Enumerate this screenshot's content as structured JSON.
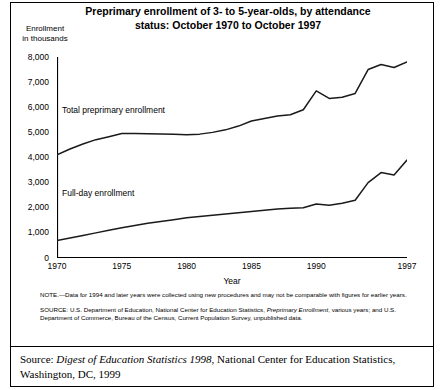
{
  "title": {
    "line1": "Preprimary enrollment of 3- to 5-year-olds, by attendance",
    "line2": "status:  October 1970 to October 1997"
  },
  "axis_caption": {
    "line1": "Enrollment",
    "line2": "in thousands"
  },
  "notes": {
    "note": "NOTE.—Data for 1994 and later years were collected using new procedures and may not be comparable with figures for earlier years.",
    "source_pre": "SOURCE:  U.S. Department of Education, National Center for Education Statistics, ",
    "source_italic": "Preprimary Enrollment",
    "source_post": ", various years; and U.S. Department of Commerce, Bureau of the Census, Current Population Survey, unpublished data."
  },
  "citation": {
    "prefix": "Source: ",
    "italic": "Digest of Education Statistics 1998",
    "suffix": ", National Center for Education Statistics, Washington, DC, 1999"
  },
  "chart_data": {
    "type": "line",
    "title": "Preprimary enrollment of 3- to 5-year-olds, by attendance status:  October 1970 to October 1997",
    "xlabel": "Year",
    "ylabel": "Enrollment in thousands",
    "xlim": [
      1970,
      1997
    ],
    "ylim": [
      0,
      8000
    ],
    "ytick_labels": [
      "8,000",
      "7,000",
      "6,000",
      "5,000",
      "4,000",
      "3,000",
      "2,000",
      "1,000",
      "0"
    ],
    "ytick_values": [
      8000,
      7000,
      6000,
      5000,
      4000,
      3000,
      2000,
      1000,
      0
    ],
    "xtick_labels": [
      "1970",
      "1975",
      "1980",
      "1985",
      "1990",
      "1997"
    ],
    "xtick_values": [
      1970,
      1975,
      1980,
      1985,
      1990,
      1997
    ],
    "minor_xticks_every": 1,
    "grid": false,
    "legend": "in-plot labels",
    "x": [
      1970,
      1971,
      1972,
      1973,
      1974,
      1975,
      1976,
      1977,
      1978,
      1979,
      1980,
      1981,
      1982,
      1983,
      1984,
      1985,
      1986,
      1987,
      1988,
      1989,
      1990,
      1991,
      1992,
      1993,
      1994,
      1995,
      1996,
      1997
    ],
    "series": [
      {
        "name": "Total preprimary enrollment",
        "label": "Total preprimary enrollment",
        "values": [
          4104,
          4340,
          4540,
          4710,
          4830,
          4955,
          4960,
          4950,
          4940,
          4930,
          4910,
          4930,
          5000,
          5100,
          5250,
          5450,
          5550,
          5650,
          5700,
          5900,
          6650,
          6350,
          6400,
          6550,
          7500,
          7700,
          7580,
          7800
        ]
      },
      {
        "name": "Full-day enrollment",
        "label": "Full-day enrollment",
        "values": [
          698,
          800,
          900,
          1000,
          1100,
          1200,
          1290,
          1380,
          1450,
          1520,
          1600,
          1650,
          1700,
          1750,
          1800,
          1850,
          1900,
          1950,
          1980,
          2000,
          2150,
          2100,
          2180,
          2300,
          3000,
          3400,
          3300,
          3900
        ]
      }
    ],
    "annotations": [
      {
        "text": "Total preprimary enrollment",
        "series": "Total preprimary enrollment"
      },
      {
        "text": "Full-day enrollment",
        "series": "Full-day enrollment"
      }
    ]
  }
}
